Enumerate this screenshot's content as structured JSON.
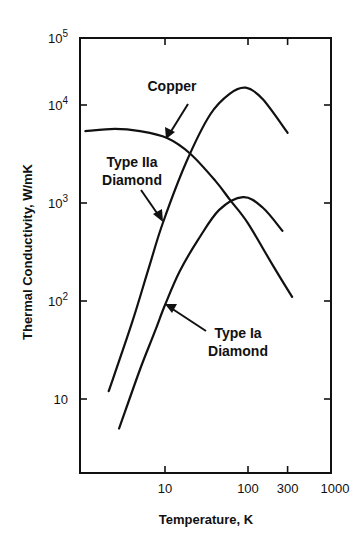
{
  "chart_data": {
    "type": "line",
    "title": "",
    "xlabel": "Temperature, K",
    "ylabel": "Thermal Conductivity, W/mK",
    "xscale": "log",
    "yscale": "log",
    "xlim": [
      1,
      1000
    ],
    "ylim": [
      1,
      100000
    ],
    "grid": false,
    "legend": "none (curves labeled directly with arrows)",
    "x_ticks": [
      {
        "value": 10,
        "label": "10"
      },
      {
        "value": 100,
        "label": "100"
      },
      {
        "value": 300,
        "label": "300"
      },
      {
        "value": 1000,
        "label": "1000"
      }
    ],
    "y_ticks": [
      {
        "value": 10,
        "label": "10",
        "base": "10",
        "exp": ""
      },
      {
        "value": 100,
        "label": "10^2",
        "base": "10",
        "exp": "2"
      },
      {
        "value": 1000,
        "label": "10^3",
        "base": "10",
        "exp": "3"
      },
      {
        "value": 10000,
        "label": "10^4",
        "base": "10",
        "exp": "4"
      },
      {
        "value": 100000,
        "label": "10^5",
        "base": "10",
        "exp": "5"
      }
    ],
    "series": [
      {
        "name": "Copper",
        "points": [
          [
            1.1,
            5400
          ],
          [
            2.5,
            5700
          ],
          [
            5,
            5400
          ],
          [
            10.6,
            4600
          ],
          [
            20,
            3200
          ],
          [
            40,
            1700
          ],
          [
            61,
            1070
          ],
          [
            100,
            620
          ],
          [
            200,
            230
          ],
          [
            340,
            110
          ]
        ]
      },
      {
        "name": "Type IIa Diamond",
        "points": [
          [
            2.1,
            12
          ],
          [
            4,
            60
          ],
          [
            6.5,
            230
          ],
          [
            9.5,
            640
          ],
          [
            18,
            2600
          ],
          [
            35,
            8000
          ],
          [
            60,
            13000
          ],
          [
            94,
            15000
          ],
          [
            150,
            11500
          ],
          [
            300,
            5200
          ]
        ]
      },
      {
        "name": "Type Ia Diamond",
        "points": [
          [
            2.8,
            5
          ],
          [
            5,
            20
          ],
          [
            7.5,
            48
          ],
          [
            10,
            91
          ],
          [
            15,
            200
          ],
          [
            25,
            420
          ],
          [
            45,
            850
          ],
          [
            87,
            1150
          ],
          [
            150,
            900
          ],
          [
            260,
            520
          ]
        ]
      }
    ],
    "annotations": [
      {
        "text": "Copper",
        "points_to": "Copper"
      },
      {
        "text": "Type IIa\nDiamond",
        "points_to": "Type IIa Diamond"
      },
      {
        "text": "Type Ia\nDiamond",
        "points_to": "Type Ia Diamond"
      }
    ]
  },
  "labels": {
    "copper": "Copper",
    "type2a_line1": "Type IIa",
    "type2a_line2": "Diamond",
    "type1a_line1": "Type Ia",
    "type1a_line2": "Diamond"
  },
  "style": {
    "line_color": "#111111",
    "background": "#ffffff"
  }
}
